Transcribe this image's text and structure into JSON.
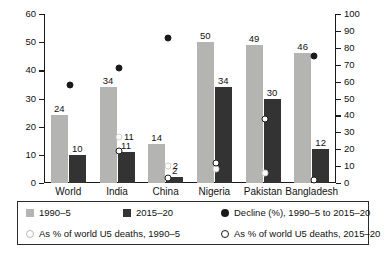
{
  "chart_data": {
    "type": "bar",
    "title": "",
    "subtitle": "",
    "xlabel": "",
    "ylabel": "",
    "categories": [
      "World",
      "India",
      "China",
      "Nigeria",
      "Pakistan",
      "Bangladesh"
    ],
    "left_axis": {
      "ticks": [
        0,
        10,
        20,
        30,
        40,
        50,
        60
      ],
      "ylim": [
        0,
        60
      ],
      "label": ""
    },
    "right_axis": {
      "ticks": [
        0,
        10,
        20,
        30,
        40,
        50,
        60,
        70,
        80,
        90,
        100
      ],
      "ylim": [
        0,
        100
      ],
      "label": ""
    },
    "grid": false,
    "legend_position": "bottom",
    "series": [
      {
        "name": "1990–5",
        "kind": "bar",
        "axis": "left",
        "color": "#b4b4b2",
        "values": [
          24,
          34,
          14,
          50,
          49,
          46
        ],
        "labels": [
          "24",
          "34",
          "14",
          "50",
          "49",
          "46"
        ]
      },
      {
        "name": "2015–20",
        "kind": "bar",
        "axis": "left",
        "color": "#333333",
        "values": [
          10,
          11,
          2,
          34,
          30,
          12
        ],
        "labels": [
          "10",
          "11",
          "2",
          "34",
          "30",
          "12"
        ]
      },
      {
        "name": "Decline (%), 1990–5 to 2015–20",
        "kind": "marker-filled",
        "axis": "right",
        "color": "#1a1a1a",
        "values": [
          58,
          68,
          86,
          null,
          null,
          75
        ],
        "labels": [
          "",
          "",
          "",
          "",
          "",
          ""
        ]
      },
      {
        "name": "As % of world U5 deaths, 1990–5",
        "kind": "marker-open-light",
        "axis": "right",
        "color": "#ffffff",
        "values": [
          null,
          27,
          10,
          8,
          6,
          null
        ],
        "labels": [
          "",
          "11",
          "2",
          "",
          "",
          ""
        ]
      },
      {
        "name": "As % of world U5 deaths, 2015–20",
        "kind": "marker-open-dark",
        "axis": "right",
        "color": "#ffffff",
        "values": [
          null,
          19,
          3,
          12,
          38,
          2
        ],
        "labels": [
          "",
          "",
          "",
          "",
          "",
          ""
        ]
      }
    ]
  },
  "legend": {
    "items": [
      {
        "glyph": "swatch-light",
        "label": "1990–5"
      },
      {
        "glyph": "swatch-dark",
        "label": "2015–20"
      },
      {
        "glyph": "dot-filled",
        "label": "Decline (%), 1990–5 to 2015–20"
      },
      {
        "glyph": "dot-open-light",
        "label": "As % of world U5 deaths, 1990–5"
      },
      {
        "glyph": "dot-open-dark",
        "label": "As % of world U5 deaths, 2015–20"
      }
    ]
  }
}
